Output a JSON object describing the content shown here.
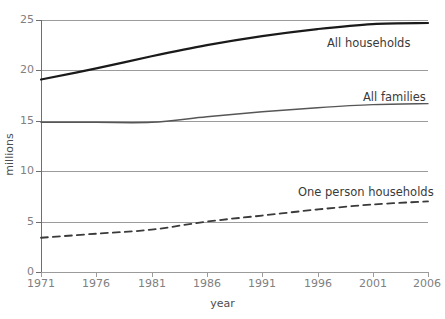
{
  "chart_data": {
    "type": "line",
    "title": "",
    "xlabel": "year",
    "ylabel": "millions",
    "xlim": [
      1971,
      2006
    ],
    "ylim": [
      0,
      25
    ],
    "grid": true,
    "legend_position": "inline-right-of-series",
    "xticks": [
      "1971",
      "1976",
      "1981",
      "1986",
      "1991",
      "1996",
      "2001",
      "2006"
    ],
    "yticks": [
      "0",
      "5",
      "10",
      "15",
      "20",
      "25"
    ],
    "x": [
      1971,
      1976,
      1981,
      1986,
      1991,
      1996,
      2001,
      2006
    ],
    "series": [
      {
        "name": "All households",
        "style": "solid",
        "color": "#1a1a1a",
        "width": 2.2,
        "values": [
          19.1,
          20.2,
          21.4,
          22.5,
          23.4,
          24.1,
          24.6,
          24.7
        ]
      },
      {
        "name": "All families",
        "style": "solid",
        "color": "#565656",
        "width": 1.4,
        "values": [
          14.85,
          14.85,
          14.85,
          15.4,
          15.9,
          16.3,
          16.6,
          16.7
        ]
      },
      {
        "name": "One person households",
        "style": "dashed",
        "color": "#3a3a3a",
        "width": 1.8,
        "values": [
          3.4,
          3.8,
          4.2,
          5.0,
          5.6,
          6.2,
          6.7,
          7.0
        ]
      }
    ]
  },
  "axes": {
    "x_title": "year",
    "y_title": "millions",
    "x_tick_labels": [
      "1971",
      "1976",
      "1981",
      "1986",
      "1991",
      "1996",
      "2001",
      "2006"
    ],
    "y_tick_labels": [
      "0",
      "5",
      "10",
      "15",
      "20",
      "25"
    ]
  },
  "labels": {
    "all_households": "All households",
    "all_families": "All families",
    "one_person_households": "One person households"
  },
  "colors": {
    "grid": "#9b9b9b",
    "axis": "#6e6e6e",
    "tick_text": "#808080",
    "axis_title": "#4d4d4d",
    "series_label": "#3a3a3a",
    "background": "#ffffff"
  }
}
